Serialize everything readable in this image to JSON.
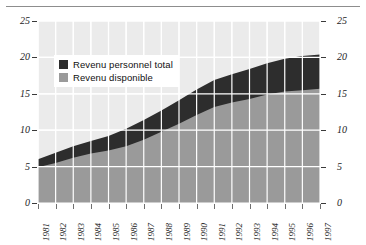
{
  "chart_data": {
    "type": "area",
    "title": "",
    "subtitle": "",
    "xlabel": "",
    "ylabel": "",
    "categories": [
      "1981",
      "1982",
      "1983",
      "1984",
      "1985",
      "1986",
      "1987",
      "1988",
      "1989",
      "1990",
      "1991",
      "1992",
      "1993",
      "1994",
      "1995",
      "1996",
      "1997"
    ],
    "series": [
      {
        "name": "Revenu personnel total",
        "color": "#2d2d2d",
        "values": [
          6.0,
          6.9,
          7.8,
          8.5,
          9.2,
          10.2,
          11.4,
          12.7,
          14.1,
          15.6,
          16.9,
          17.7,
          18.4,
          19.2,
          19.8,
          20.2,
          20.4
        ]
      },
      {
        "name": "Revenu disponible",
        "color": "#9a9a9a",
        "values": [
          4.9,
          5.5,
          6.2,
          6.8,
          7.2,
          7.8,
          8.7,
          9.8,
          10.9,
          12.1,
          13.2,
          13.8,
          14.3,
          14.9,
          15.3,
          15.5,
          15.7
        ]
      }
    ],
    "ylim": [
      0,
      25
    ],
    "yticks": [
      0,
      5,
      10,
      15,
      20,
      25
    ],
    "ytick_labels": [
      "0",
      "5",
      "10",
      "15",
      "20",
      "25"
    ],
    "y_axis_right": true,
    "y_axis_right_labels": [
      "0",
      "5",
      "10",
      "15",
      "20",
      "25"
    ],
    "grid": true,
    "grid_color": "#ffffff",
    "plot_background": "#ebebeb",
    "legend_position": "upper-left"
  },
  "legend": {
    "items": [
      {
        "label": "Revenu personnel total",
        "color": "#2d2d2d"
      },
      {
        "label": "Revenu disponible",
        "color": "#9a9a9a"
      }
    ]
  },
  "figure": {
    "rule_color": "#8d8d8d"
  }
}
